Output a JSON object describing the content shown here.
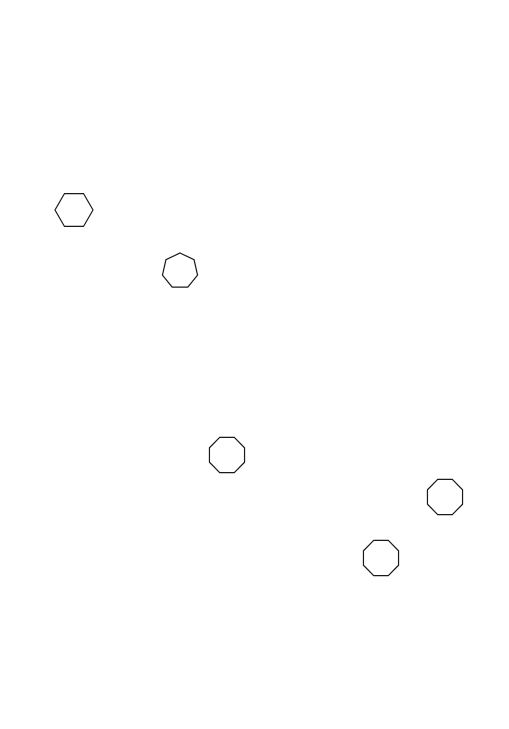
{
  "canvas": {
    "width": 509,
    "height": 729,
    "background": "#ffffff"
  },
  "style": {
    "stroke": "#1a1a1a",
    "stroke_width": 1.2,
    "fill": "none"
  },
  "shapes": [
    {
      "type": "hexagon",
      "sides": 6,
      "cx": 74,
      "cy": 210,
      "r": 19,
      "rotation_deg": 0
    },
    {
      "type": "heptagon",
      "sides": 7,
      "cx": 180,
      "cy": 271,
      "r": 18,
      "rotation_deg": -90
    },
    {
      "type": "octagon",
      "sides": 8,
      "cx": 227,
      "cy": 455,
      "r": 19,
      "rotation_deg": 22.5
    },
    {
      "type": "octagon",
      "sides": 8,
      "cx": 445,
      "cy": 497,
      "r": 19,
      "rotation_deg": 22.5
    },
    {
      "type": "octagon",
      "sides": 8,
      "cx": 381,
      "cy": 558,
      "r": 19,
      "rotation_deg": 22.5
    }
  ]
}
